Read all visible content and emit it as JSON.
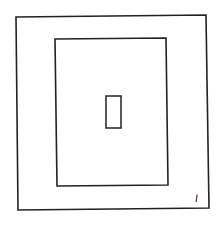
{
  "diagram": {
    "stroke_color": "#222222",
    "background": "#ffffff",
    "shapes": [
      {
        "name": "outer-rectangle",
        "points": [
          [
            16,
            17
          ],
          [
            206,
            15
          ],
          [
            209,
            208
          ],
          [
            18,
            210
          ]
        ],
        "stroke_width": 1.6
      },
      {
        "name": "inner-rectangle",
        "points": [
          [
            55,
            39
          ],
          [
            166,
            38
          ],
          [
            168,
            185
          ],
          [
            57,
            186
          ]
        ],
        "stroke_width": 1.6
      },
      {
        "name": "center-rectangle",
        "points": [
          [
            106,
            96
          ],
          [
            121,
            96
          ],
          [
            121,
            128
          ],
          [
            106,
            128
          ]
        ],
        "stroke_width": 1.5
      }
    ],
    "label": {
      "text": "I",
      "x": 195,
      "y": 193
    }
  }
}
